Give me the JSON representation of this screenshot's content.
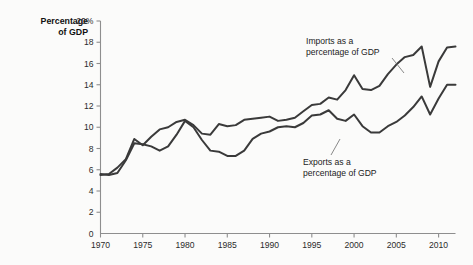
{
  "chart_data": {
    "type": "line",
    "title": "",
    "subtitle": "",
    "xlabel": "",
    "ylabel": "Percentage of GDP",
    "ylabel_line1": "Percentage",
    "ylabel_line2": "of GDP",
    "xlim": [
      1970,
      2012
    ],
    "ylim": [
      0,
      20
    ],
    "grid": false,
    "legend_position": "inline-annotation",
    "y_ticks": [
      0,
      2,
      4,
      6,
      8,
      10,
      12,
      14,
      16,
      18,
      20
    ],
    "y_tick_labels": [
      "0",
      "2",
      "4",
      "6",
      "8",
      "10",
      "12",
      "14",
      "16",
      "18",
      "20%"
    ],
    "x_ticks": [
      1970,
      1975,
      1980,
      1985,
      1990,
      1995,
      2000,
      2005,
      2010
    ],
    "x_tick_labels": [
      "1970",
      "1975",
      "1980",
      "1985",
      "1990",
      "1995",
      "2000",
      "2005",
      "2010"
    ],
    "x": [
      1970,
      1971,
      1972,
      1973,
      1974,
      1975,
      1976,
      1977,
      1978,
      1979,
      1980,
      1981,
      1982,
      1983,
      1984,
      1985,
      1986,
      1987,
      1988,
      1989,
      1990,
      1991,
      1992,
      1993,
      1994,
      1995,
      1996,
      1997,
      1998,
      1999,
      2000,
      2001,
      2002,
      2003,
      2004,
      2005,
      2006,
      2007,
      2008,
      2009,
      2010,
      2011,
      2012
    ],
    "series": [
      {
        "name": "Imports as a percentage of GDP",
        "color": "#3a3a3a",
        "values": [
          5.5,
          5.6,
          6.2,
          7.0,
          8.9,
          8.3,
          9.1,
          9.8,
          10.0,
          10.5,
          10.7,
          10.2,
          9.4,
          9.3,
          10.3,
          10.1,
          10.2,
          10.7,
          10.8,
          10.9,
          11.0,
          10.6,
          10.7,
          10.9,
          11.5,
          12.1,
          12.2,
          12.8,
          12.6,
          13.5,
          14.9,
          13.6,
          13.5,
          13.9,
          15.0,
          15.9,
          16.6,
          16.8,
          17.6,
          13.8,
          16.2,
          17.5,
          17.6
        ]
      },
      {
        "name": "Exports as a percentage of GDP",
        "color": "#3a3a3a",
        "values": [
          5.6,
          5.5,
          5.7,
          6.9,
          8.5,
          8.4,
          8.2,
          7.8,
          8.2,
          9.3,
          10.6,
          10.0,
          8.8,
          7.8,
          7.7,
          7.3,
          7.3,
          7.8,
          8.9,
          9.4,
          9.6,
          10.0,
          10.1,
          10.0,
          10.4,
          11.1,
          11.2,
          11.6,
          10.8,
          10.6,
          11.2,
          10.1,
          9.5,
          9.5,
          10.1,
          10.5,
          11.1,
          11.9,
          12.9,
          11.2,
          12.7,
          14.0,
          14.0
        ]
      }
    ],
    "annotations": [
      {
        "text_line1": "Imports as a",
        "text_line2": "percentage of GDP",
        "target": "imports"
      },
      {
        "text_line1": "Exports as a",
        "text_line2": "percentage of GDP",
        "target": "exports"
      }
    ]
  }
}
